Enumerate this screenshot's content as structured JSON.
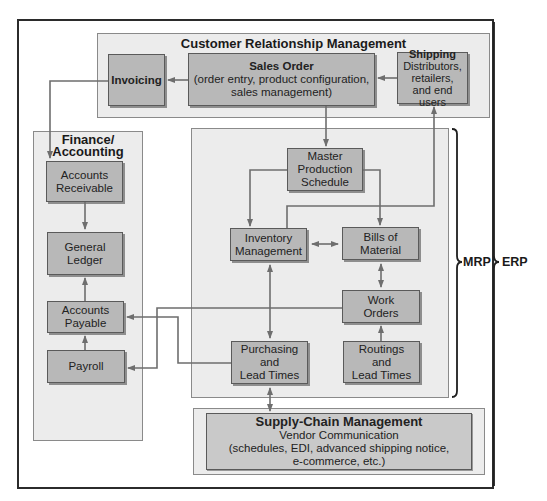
{
  "diagram": {
    "type": "ERP system flow diagram",
    "colors": {
      "frame_border": "#2b2b2b",
      "panel_fill": "#ececec",
      "panel_border": "#8a8a8a",
      "box_fill": "#b8b8b8",
      "box_border": "#5a5a5a",
      "connector": "#6e6e6e"
    },
    "crm": {
      "title": "Customer Relationship Management",
      "invoicing": "Invoicing",
      "sales_order": {
        "title": "Sales Order",
        "line1": "(order entry, product configuration,",
        "line2": "sales management)"
      },
      "shipping": {
        "title": "Shipping",
        "line1": "Distributors,",
        "line2": "retailers,",
        "line3": "and end users"
      }
    },
    "finance": {
      "title_line1": "Finance/",
      "title_line2": "Accounting",
      "accounts_receivable": [
        "Accounts",
        "Receivable"
      ],
      "general_ledger": [
        "General",
        "Ledger"
      ],
      "accounts_payable": [
        "Accounts",
        "Payable"
      ],
      "payroll": "Payroll"
    },
    "mrp": {
      "master_production_schedule": [
        "Master",
        "Production",
        "Schedule"
      ],
      "inventory_management": [
        "Inventory",
        "Management"
      ],
      "bills_of_material": [
        "Bills of",
        "Material"
      ],
      "work_orders": [
        "Work",
        "Orders"
      ],
      "purchasing": [
        "Purchasing",
        "and",
        "Lead Times"
      ],
      "routings": [
        "Routings",
        "and",
        "Lead Times"
      ]
    },
    "scm": {
      "title": "Supply-Chain Management",
      "line1": "Vendor Communication",
      "line2": "(schedules, EDI, advanced shipping notice,",
      "line3": "e-commerce, etc.)"
    },
    "labels": {
      "mrp": "MRP",
      "erp": "ERP"
    }
  }
}
